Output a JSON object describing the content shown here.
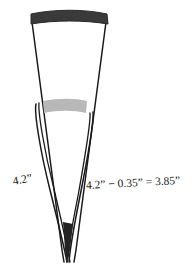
{
  "figure": {
    "kind": "tweezers-measurement-diagram",
    "background_color": "#ffffff",
    "outline_color": "#1a1a1a",
    "cap_color": "#3a3a3a",
    "band_color": "#b8b8b8",
    "tip_color": "#232323"
  },
  "labels": {
    "left_measurement": "4.2”",
    "right_measurement": "4.2” − 0.35” = 3.85”"
  },
  "parts": {
    "top_cap_name": "top-cap",
    "grip_band_name": "grip-band",
    "tip_name": "tweezer-tip"
  },
  "measurements": {
    "full_length_in": 4.2,
    "offset_in": 0.35,
    "result_in": 3.85,
    "unit": "inches"
  }
}
